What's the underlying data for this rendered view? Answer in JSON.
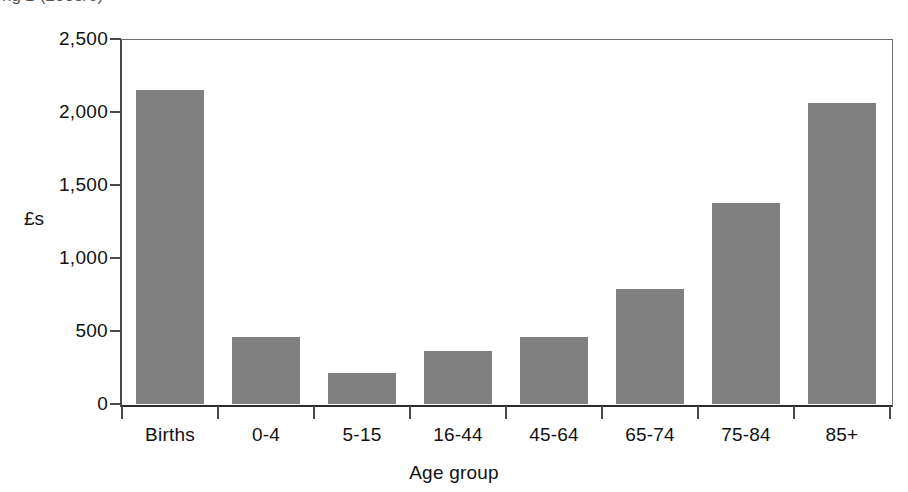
{
  "title_fragment": "ng  £  (2005/6)",
  "chart_data": {
    "type": "bar",
    "title": "",
    "xlabel": "Age group",
    "ylabel": "£s",
    "categories": [
      "Births",
      "0-4",
      "5-15",
      "16-44",
      "45-64",
      "65-74",
      "75-84",
      "85+"
    ],
    "values": [
      2150,
      460,
      210,
      360,
      460,
      790,
      1380,
      2060
    ],
    "ylim": [
      0,
      2500
    ],
    "yticks": [
      0,
      500,
      1000,
      1500,
      2000,
      2500
    ],
    "ytick_labels": [
      "0",
      "500",
      "1,000",
      "1,500",
      "2,000",
      "2,500"
    ],
    "grid": false,
    "legend": null,
    "bar_color": "#808080",
    "axis_color": "#4a4a4a"
  }
}
